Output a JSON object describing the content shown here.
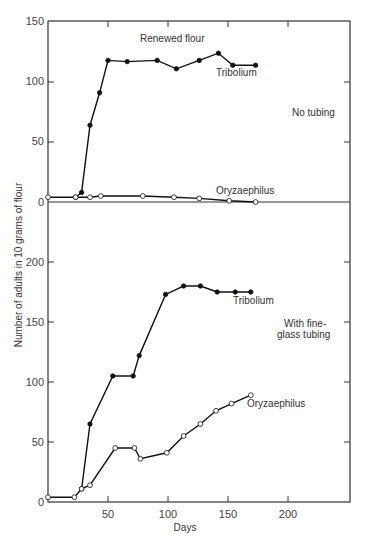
{
  "chart_data": [
    {
      "type": "line",
      "panel": "upper",
      "title": "Renewed flour",
      "annotation": "No tubing",
      "xlabel": "Days",
      "ylabel": "Number of adults in 10 grams of flour",
      "xlim": [
        0,
        250
      ],
      "ylim": [
        0,
        150
      ],
      "yticks": [
        0,
        50,
        100,
        150
      ],
      "grid": false,
      "series": [
        {
          "name": "Tribolium",
          "marker": "filled",
          "x": [
            23,
            28,
            35,
            43,
            50,
            66,
            91,
            107,
            126,
            142,
            154,
            173
          ],
          "y": [
            4,
            8,
            64,
            91,
            118,
            117,
            118,
            111,
            118,
            124,
            114,
            114
          ]
        },
        {
          "name": "Oryzaephilus",
          "marker": "open",
          "x": [
            0,
            23,
            35,
            44,
            79,
            105,
            126,
            151,
            173
          ],
          "y": [
            4,
            4,
            4,
            5,
            5,
            4,
            3,
            1,
            0
          ]
        }
      ]
    },
    {
      "type": "line",
      "panel": "lower",
      "title": "",
      "annotation": "With fine-glass tubing",
      "xlabel": "Days",
      "ylabel": "Number of adults in 10 grams of flour",
      "xlim": [
        0,
        250
      ],
      "ylim": [
        0,
        200
      ],
      "xticks": [
        50,
        100,
        150,
        200
      ],
      "yticks": [
        0,
        50,
        100,
        150,
        200
      ],
      "grid": false,
      "series": [
        {
          "name": "Tribolium",
          "marker": "filled",
          "x": [
            28,
            35,
            54,
            71,
            76,
            98,
            113,
            127,
            141,
            156,
            169
          ],
          "y": [
            11,
            65,
            105,
            105,
            122,
            173,
            180,
            180,
            175,
            175,
            175
          ]
        },
        {
          "name": "Oryzaephilus",
          "marker": "open",
          "x": [
            0,
            22,
            28,
            35,
            56,
            72,
            77,
            99,
            113,
            127,
            140,
            153,
            169
          ],
          "y": [
            4,
            4,
            11,
            14,
            45,
            45,
            36,
            41,
            55,
            65,
            76,
            82,
            89
          ]
        }
      ]
    }
  ],
  "labels": {
    "upper_title": "Renewed flour",
    "upper_tribolium": "Tribolium",
    "upper_oryzaephilus": "Oryzaephilus",
    "upper_annotation": "No tubing",
    "lower_tribolium": "Tribolium",
    "lower_annotation_line1": "With fine-",
    "lower_annotation_line2": "glass tubing",
    "lower_oryzaephilus": "Oryzaephilus",
    "ylabel": "Number of adults in 10 grams of flour",
    "xlabel": "Days",
    "upper_yticks": [
      "150",
      "100",
      "50",
      "0"
    ],
    "lower_yticks": [
      "200",
      "150",
      "100",
      "50",
      "0"
    ],
    "xticks": [
      "50",
      "100",
      "150",
      "200"
    ]
  }
}
